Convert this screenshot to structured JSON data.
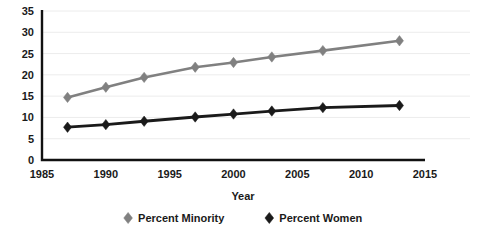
{
  "chart_data": {
    "type": "line",
    "title": "",
    "xlabel": "Year",
    "ylabel": "",
    "x": [
      1987,
      1990,
      1993,
      1997,
      2000,
      2003,
      2007,
      2013
    ],
    "xlim": [
      1985,
      2015
    ],
    "ylim": [
      0,
      35
    ],
    "xticks": [
      1985,
      1990,
      1995,
      2000,
      2005,
      2010,
      2015
    ],
    "yticks": [
      0,
      5,
      10,
      15,
      20,
      25,
      30,
      35
    ],
    "grid": "horizontal",
    "legend_position": "bottom",
    "series": [
      {
        "name": "Percent Minority",
        "color": "#808080",
        "marker": "diamond",
        "values": [
          14.7,
          17.1,
          19.4,
          21.8,
          22.9,
          24.2,
          25.7,
          28.0
        ]
      },
      {
        "name": "Percent Women",
        "color": "#1a1a1a",
        "marker": "diamond",
        "values": [
          7.7,
          8.3,
          9.1,
          10.1,
          10.8,
          11.5,
          12.3,
          12.8
        ]
      }
    ]
  },
  "axis": {
    "x_tick_labels": [
      "1985",
      "1990",
      "1995",
      "2000",
      "2005",
      "2010",
      "2015"
    ],
    "y_tick_labels": [
      "0",
      "5",
      "10",
      "15",
      "20",
      "25",
      "30",
      "35"
    ],
    "x_title": "Year"
  },
  "legend": {
    "items": [
      {
        "label": "Percent Minority",
        "color": "#808080"
      },
      {
        "label": "Percent Women",
        "color": "#1a1a1a"
      }
    ]
  }
}
